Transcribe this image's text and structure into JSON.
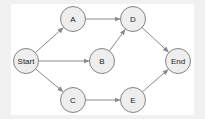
{
  "diagram": {
    "type": "flow-graph",
    "colors": {
      "background_outer": "#f1f1f1",
      "background_inner": "#ffffff",
      "node_fill": "#eeeeee",
      "node_stroke": "#777777",
      "edge": "#8a8a8a",
      "text": "#222222"
    },
    "nodes": [
      {
        "id": "start",
        "label": "Start",
        "cx": 26,
        "cy": 61,
        "r": 12.5
      },
      {
        "id": "a",
        "label": "A",
        "cx": 73,
        "cy": 19,
        "r": 12.5
      },
      {
        "id": "b",
        "label": "B",
        "cx": 102,
        "cy": 61,
        "r": 12.5
      },
      {
        "id": "c",
        "label": "C",
        "cx": 73,
        "cy": 100,
        "r": 12.5
      },
      {
        "id": "d",
        "label": "D",
        "cx": 133,
        "cy": 19,
        "r": 12.5
      },
      {
        "id": "e",
        "label": "E",
        "cx": 133,
        "cy": 100,
        "r": 12.5
      },
      {
        "id": "end",
        "label": "End",
        "cx": 178,
        "cy": 61,
        "r": 12.5
      }
    ],
    "edges": [
      {
        "from": "start",
        "to": "a"
      },
      {
        "from": "start",
        "to": "b"
      },
      {
        "from": "start",
        "to": "c"
      },
      {
        "from": "a",
        "to": "d"
      },
      {
        "from": "b",
        "to": "d"
      },
      {
        "from": "c",
        "to": "e"
      },
      {
        "from": "d",
        "to": "end"
      },
      {
        "from": "e",
        "to": "end"
      }
    ]
  }
}
